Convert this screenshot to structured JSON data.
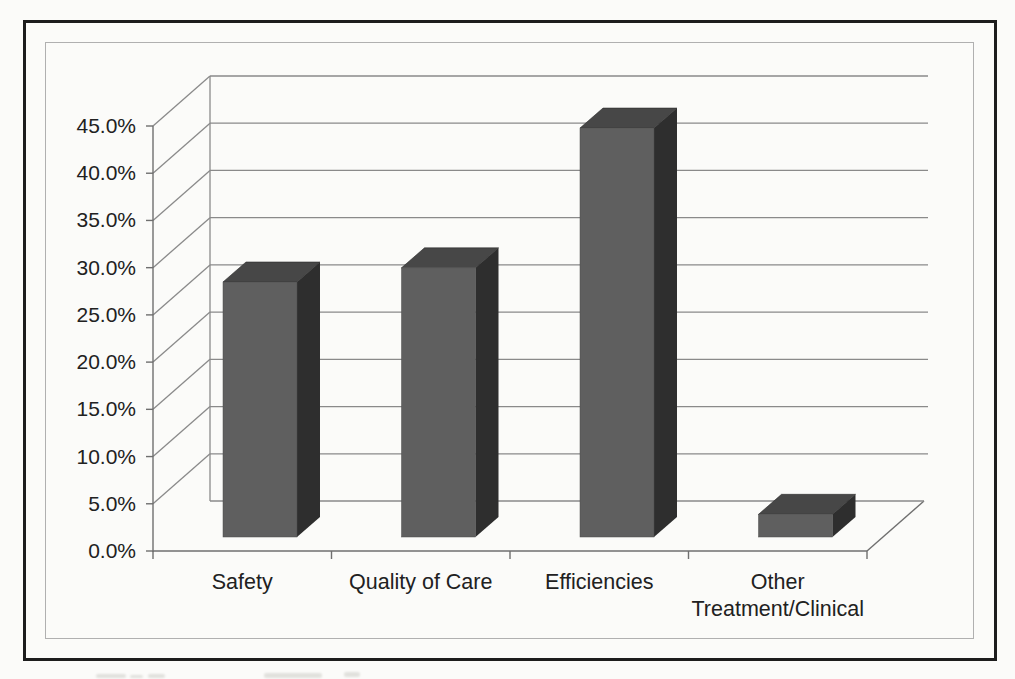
{
  "chart_data": {
    "type": "bar",
    "style": "3d-column",
    "title": "",
    "xlabel": "",
    "ylabel": "",
    "categories": [
      "Safety",
      "Quality of Care",
      "Efficiencies",
      "Other Treatment/Clinical"
    ],
    "category_display_lines": [
      [
        "Safety"
      ],
      [
        "Quality of Care"
      ],
      [
        "Efficiencies"
      ],
      [
        "Other",
        "Treatment/Clinical"
      ]
    ],
    "values": [
      27.0,
      28.5,
      43.3,
      2.4
    ],
    "unit": "%",
    "ylim": [
      0,
      45
    ],
    "ytick_step": 5,
    "ytick_labels": [
      "0.0%",
      "5.0%",
      "10.0%",
      "15.0%",
      "20.0%",
      "25.0%",
      "30.0%",
      "35.0%",
      "40.0%",
      "45.0%"
    ],
    "grid": true,
    "legend": "none",
    "colors": {
      "bar_front": "#5f5f5f",
      "bar_top": "#474747",
      "bar_side": "#2e2e2e",
      "gridline": "#8a8a8a",
      "axis": "#6f6f6f",
      "text": "#212121",
      "outer_border": "#1d1d1d",
      "inner_border": "#b0b0b0",
      "background": "#fbfbf9"
    }
  }
}
